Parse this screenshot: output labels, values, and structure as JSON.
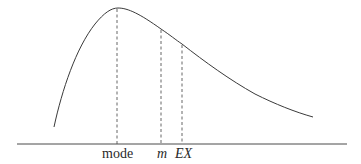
{
  "diagram": {
    "type": "right-skewed probability density curve",
    "colors": {
      "curve": "#3a3a3a",
      "axis": "#4a4a4a",
      "markers": "#555555",
      "text": "#2a2a2a",
      "background": "#ffffff"
    },
    "markers": [
      {
        "id": "mode",
        "label": "mode",
        "italic": false
      },
      {
        "id": "median",
        "label": "m",
        "italic": true
      },
      {
        "id": "mean",
        "label": "EX",
        "italic": true
      }
    ]
  }
}
